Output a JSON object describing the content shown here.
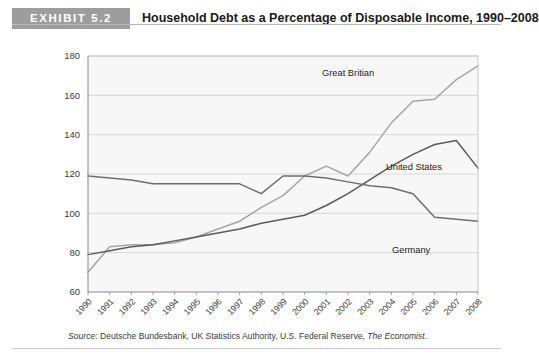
{
  "header": {
    "exhibit_tag": "EXHIBIT 5.2",
    "title": "Household Debt as a Percentage of Disposable Income, 1990–2008"
  },
  "source": {
    "label": "Source:",
    "text": " Deutsche Bundesbank, UK Statistics Authority, U.S. Federal Reserve, ",
    "italic_part": "The Economist",
    "tail": "."
  },
  "colors": {
    "tag_background": "#9d9d9d",
    "tag_text": "#ffffff",
    "plot_background": "#f7f7f7",
    "grid": "#d4d4d4",
    "axis": "#8a8a8a",
    "great_britain": "#a6a6a6",
    "united_states": "#5b5b5b",
    "germany": "#6e6e6e"
  },
  "chart_data": {
    "type": "line",
    "title": "Household Debt as a Percentage of Disposable Income, 1990–2008",
    "xlabel": "",
    "ylabel": "",
    "ylim": [
      60,
      180
    ],
    "yticks": [
      60,
      80,
      100,
      120,
      140,
      160,
      180
    ],
    "grid": true,
    "legend_position": "inline-labels",
    "categories": [
      "1990",
      "1991",
      "1992",
      "1993",
      "1994",
      "1995",
      "1996",
      "1997",
      "1998",
      "1999",
      "2000",
      "2001",
      "2002",
      "2003",
      "2004",
      "2005",
      "2006",
      "2007",
      "2008"
    ],
    "x": [
      1990,
      1991,
      1992,
      1993,
      1994,
      1995,
      1996,
      1997,
      1998,
      1999,
      2000,
      2001,
      2002,
      2003,
      2004,
      2005,
      2006,
      2007,
      2008
    ],
    "series": [
      {
        "name": "Great Britian",
        "color": "#a6a6a6",
        "values": [
          70,
          83,
          84,
          84,
          85,
          88,
          92,
          96,
          103,
          109,
          119,
          124,
          119,
          131,
          146,
          157,
          158,
          168,
          175
        ]
      },
      {
        "name": "United States",
        "color": "#5b5b5b",
        "values": [
          79,
          81,
          83,
          84,
          86,
          88,
          90,
          92,
          95,
          97,
          99,
          104,
          110,
          117,
          124,
          130,
          135,
          137,
          123
        ]
      },
      {
        "name": "Germany",
        "color": "#6e6e6e",
        "values": [
          119,
          118,
          117,
          115,
          115,
          115,
          115,
          115,
          110,
          119,
          119,
          118,
          116,
          114,
          113,
          110,
          98,
          97,
          96
        ]
      }
    ],
    "annotations": [
      {
        "text": "Great Britian",
        "near_year": 2004,
        "near_value": 165
      },
      {
        "text": "United States",
        "near_value": 125,
        "near_year": 2005
      },
      {
        "text": "Germany",
        "near_value": 89,
        "near_year": 2006
      }
    ]
  }
}
